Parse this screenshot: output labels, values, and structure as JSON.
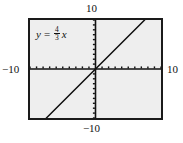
{
  "figure": {
    "kind": "graphing-calculator-screen",
    "equation": {
      "lhs": "y",
      "relation": "=",
      "numerator": "4",
      "denominator": "3",
      "variable": "x",
      "plain": "y = 4/3 x"
    },
    "axis_labels": {
      "top": "10",
      "bottom": "−10",
      "left": "−10",
      "right": "10"
    },
    "colors": {
      "screen_background": "#eeeeee",
      "frame": "#1a1a1a",
      "axis": "#111111",
      "curve": "#111111",
      "page_background": "#ffffff"
    }
  },
  "chart_data": {
    "type": "line",
    "title": "",
    "subtitle": "",
    "xlabel": "",
    "ylabel": "",
    "annotations": [
      "y = 4/3 x"
    ],
    "legend": [],
    "legend_position": "none",
    "grid": false,
    "xlim": [
      -10,
      10
    ],
    "ylim": [
      -10,
      10
    ],
    "xticks": [
      -10,
      -9,
      -8,
      -7,
      -6,
      -5,
      -4,
      -3,
      -2,
      -1,
      0,
      1,
      2,
      3,
      4,
      5,
      6,
      7,
      8,
      9,
      10
    ],
    "yticks": [
      -10,
      -9,
      -8,
      -7,
      -6,
      -5,
      -4,
      -3,
      -2,
      -1,
      0,
      1,
      2,
      3,
      4,
      5,
      6,
      7,
      8,
      9,
      10
    ],
    "xtick_labels": [
      "−10",
      "",
      "",
      "",
      "",
      "",
      "",
      "",
      "",
      "",
      "",
      "",
      "",
      "",
      "",
      "",
      "",
      "",
      "",
      "",
      "10"
    ],
    "ytick_labels": [
      "−10",
      "",
      "",
      "",
      "",
      "",
      "",
      "",
      "",
      "",
      "",
      "",
      "",
      "",
      "",
      "",
      "",
      "",
      "",
      "",
      "10"
    ],
    "tick_style": "dashes-on-axis",
    "series": [
      {
        "name": "y = 4/3 x",
        "slope": 1.3333,
        "intercept": 0,
        "x": [
          -7.5,
          -5,
          -2.5,
          0,
          2.5,
          5,
          7.5
        ],
        "values": [
          -10,
          -6.667,
          -3.333,
          0,
          3.333,
          6.667,
          10
        ],
        "color": "#111111"
      }
    ]
  }
}
